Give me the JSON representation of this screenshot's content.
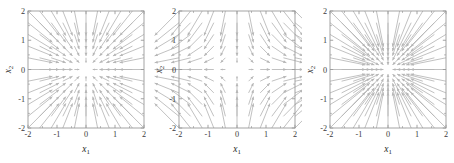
{
  "figure": {
    "background": "#ffffff",
    "panel_count": 3,
    "arrow_color": "#b6b6b6",
    "axis_color": "#9a9a9a",
    "text_color": "#262626"
  },
  "axes": {
    "xlabel_base": "x",
    "xlabel_sub": "1",
    "ylabel_base": "x",
    "ylabel_sub": "2",
    "xlim": [
      -2,
      2
    ],
    "ylim": [
      -2,
      2
    ],
    "xticks": [
      -2,
      -1,
      0,
      1,
      2
    ],
    "yticks": [
      -2,
      -1,
      0,
      1,
      2
    ],
    "xticklabels": [
      "-2",
      "-1",
      "0",
      "1",
      "2"
    ],
    "yticklabels": [
      "-2",
      "-1",
      "0",
      "1",
      "2"
    ],
    "minor_ticks_per_interval": 1,
    "grid": false
  },
  "chart_data": [
    {
      "type": "quiver",
      "title": "",
      "xlabel": "x_1",
      "ylabel": "x_2",
      "xlim": [
        -2,
        2
      ],
      "ylim": [
        -2,
        2
      ],
      "xticks": [
        -2,
        -1,
        0,
        1,
        2
      ],
      "yticks": [
        -2,
        -1,
        0,
        1,
        2
      ],
      "grid": false,
      "legend": "none",
      "grid_points": 11,
      "field": "radial-inward",
      "field_formula": {
        "u": "-x1",
        "v": "-x2"
      },
      "description": "Stable node: arrows point radially inward toward the origin; magnitude grows linearly with distance from origin.",
      "scale": 0.42
    },
    {
      "type": "quiver",
      "title": "",
      "xlabel": "x_1",
      "ylabel": "x_2",
      "xlim": [
        -2,
        2
      ],
      "ylim": [
        -2,
        2
      ],
      "xticks": [
        -2,
        -1,
        0,
        1,
        2
      ],
      "yticks": [
        -2,
        -1,
        0,
        1,
        2
      ],
      "grid": false,
      "legend": "none",
      "grid_points": 11,
      "field": "saddle",
      "field_formula": {
        "u": "x1",
        "v": "-x2"
      },
      "description": "Saddle point: arrows flow outward along the horizontal x1 direction and inward along the vertical x2 direction.",
      "scale": 0.42
    },
    {
      "type": "quiver",
      "title": "",
      "xlabel": "x_1",
      "ylabel": "x_2",
      "xlim": [
        -2,
        2
      ],
      "ylim": [
        -2,
        2
      ],
      "xticks": [
        -2,
        -1,
        0,
        1,
        2
      ],
      "yticks": [
        -2,
        -1,
        0,
        1,
        2
      ],
      "grid": false,
      "legend": "none",
      "grid_points": 11,
      "field": "radial-inward-strong",
      "field_formula": {
        "u": "-1.45*x1",
        "v": "-1.45*x2"
      },
      "description": "Stable node with faster contraction: arrows point radially inward toward the origin with longer shafts near the boundary.",
      "scale": 0.42
    }
  ]
}
